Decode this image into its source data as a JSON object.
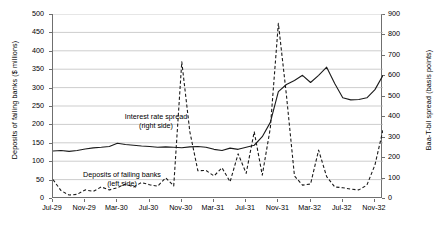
{
  "chart_data": {
    "type": "line",
    "title": "",
    "xlabel": "",
    "ylabel": "Deposits of failing banks ($ millions)",
    "y2label": "Baa-T-bil spread (basis points)",
    "ylim": [
      0,
      500
    ],
    "y2lim": [
      0,
      900
    ],
    "grid": true,
    "legend_position": "inline-annotations",
    "y_left_ticks": [
      "0",
      "50",
      "100",
      "150",
      "200",
      "250",
      "300",
      "350",
      "400",
      "450",
      "500"
    ],
    "y_right_ticks": [
      "0",
      "100",
      "200",
      "300",
      "400",
      "500",
      "600",
      "700",
      "800",
      "900"
    ],
    "x_tick_labels": [
      "Jul-29",
      "Nov-29",
      "Mar-30",
      "Jul-30",
      "Nov-30",
      "Mar-31",
      "Jul-31",
      "Nov-31",
      "Mar-32",
      "Jul-32",
      "Nov-32"
    ],
    "x_tick_positions": [
      0,
      4,
      8,
      12,
      16,
      20,
      24,
      28,
      32,
      36,
      40
    ],
    "x": [
      "Jul-29",
      "Aug-29",
      "Sep-29",
      "Oct-29",
      "Nov-29",
      "Dec-29",
      "Jan-30",
      "Feb-30",
      "Mar-30",
      "Apr-30",
      "May-30",
      "Jun-30",
      "Jul-30",
      "Aug-30",
      "Sep-30",
      "Oct-30",
      "Nov-30",
      "Dec-30",
      "Jan-31",
      "Feb-31",
      "Mar-31",
      "Apr-31",
      "May-31",
      "Jun-31",
      "Jul-31",
      "Aug-31",
      "Sep-31",
      "Oct-31",
      "Nov-31",
      "Dec-31",
      "Jan-32",
      "Feb-32",
      "Mar-32",
      "Apr-32",
      "May-32",
      "Jun-32",
      "Jul-32",
      "Aug-32",
      "Sep-32",
      "Oct-32",
      "Nov-32",
      "Dec-32"
    ],
    "series": [
      {
        "name": "Deposits of failing banks (left side)",
        "axis": "left",
        "style": "dashed",
        "color": "#1a1a1a",
        "unit": "$ millions",
        "values": [
          50,
          20,
          8,
          10,
          22,
          18,
          30,
          22,
          28,
          38,
          30,
          42,
          36,
          32,
          55,
          33,
          370,
          180,
          74,
          75,
          60,
          82,
          44,
          120,
          67,
          180,
          62,
          190,
          475,
          280,
          60,
          35,
          38,
          130,
          58,
          30,
          28,
          24,
          22,
          35,
          90,
          185
        ]
      },
      {
        "name": "Interest rate spread (right side)",
        "axis": "right",
        "style": "solid",
        "color": "#1a1a1a",
        "unit": "basis points",
        "values": [
          230,
          232,
          228,
          232,
          240,
          245,
          248,
          252,
          268,
          262,
          258,
          254,
          252,
          248,
          250,
          248,
          246,
          250,
          252,
          248,
          238,
          232,
          244,
          238,
          248,
          258,
          300,
          370,
          520,
          555,
          575,
          600,
          565,
          600,
          640,
          560,
          490,
          480,
          482,
          490,
          530,
          600
        ]
      }
    ],
    "annotations": [
      {
        "id": "spread",
        "line1": "Interest rate spread",
        "line2": "(right side)"
      },
      {
        "id": "deposits",
        "line1": "Deposits of failing banks",
        "line2": "(left side)"
      }
    ]
  }
}
